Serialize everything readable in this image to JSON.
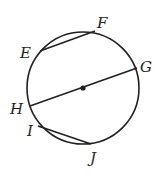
{
  "diagram": {
    "type": "circle-chords",
    "stroke_color": "#231f20",
    "circle": {
      "cx": 83,
      "cy": 88,
      "r": 56
    },
    "center_point": {
      "x": 83,
      "y": 88
    },
    "points": {
      "E": {
        "x": 40,
        "y": 51
      },
      "F": {
        "x": 95,
        "y": 31
      },
      "G": {
        "x": 137,
        "y": 68
      },
      "H": {
        "x": 30,
        "y": 106
      },
      "I": {
        "x": 38,
        "y": 126
      },
      "J": {
        "x": 91,
        "y": 144
      }
    },
    "labels": {
      "E": "E",
      "F": "F",
      "G": "G",
      "H": "H",
      "I": "I",
      "J": "J"
    },
    "segments": [
      {
        "name": "chord-EF",
        "from": "E",
        "to": "F"
      },
      {
        "name": "diameter-HG",
        "from": "H",
        "to": "G"
      },
      {
        "name": "chord-IJ",
        "from": "I",
        "to": "J"
      }
    ]
  }
}
